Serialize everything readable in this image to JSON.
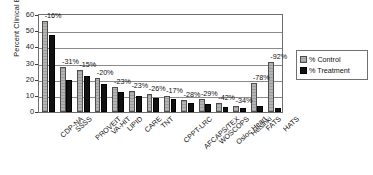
{
  "chart_data": {
    "type": "bar",
    "title": "",
    "xlabel": "",
    "ylabel": "Percent Clinical Events",
    "ylim": [
      0,
      60
    ],
    "yticks": [
      0,
      10,
      20,
      30,
      40,
      50,
      60
    ],
    "grid": true,
    "legend_position": "right",
    "categories": [
      "CDP-NA",
      "SSSS",
      "PROVEIT",
      "VA-HIT",
      "LIPID",
      "CARE",
      "TNT",
      "CPPT-LRC",
      "AFCAPS/TEX",
      "WOSCOPS",
      "Osloc Heart",
      "Helsinki",
      "FATS",
      "HATS"
    ],
    "series": [
      {
        "name": "% Control",
        "values": [
          56,
          28,
          26,
          21,
          15.5,
          13,
          11,
          9.7,
          7.7,
          7.8,
          5.5,
          3.6,
          18,
          31
        ]
      },
      {
        "name": "% Treatment",
        "values": [
          47.5,
          19.8,
          22.2,
          17.3,
          12.2,
          9.8,
          8.6,
          8.1,
          5.8,
          5.0,
          3.3,
          2.5,
          3.9,
          2.2
        ]
      }
    ],
    "annotations": [
      "-16%",
      "-31%",
      "-15%",
      "-20%",
      "-23%",
      "-23%",
      "-26%",
      "-17%",
      "-28%",
      "-29%",
      "-42%",
      "-34%",
      "-78%",
      "-92%"
    ],
    "colors": {
      "control": "#a8a8a8",
      "treatment": "#111111",
      "axis": "#6e6e6e",
      "grid": "#8a8a8a"
    }
  },
  "legend": {
    "items": [
      {
        "label": "% Control",
        "swatch": "control"
      },
      {
        "label": "% Treatment",
        "swatch": "treatment"
      }
    ]
  }
}
